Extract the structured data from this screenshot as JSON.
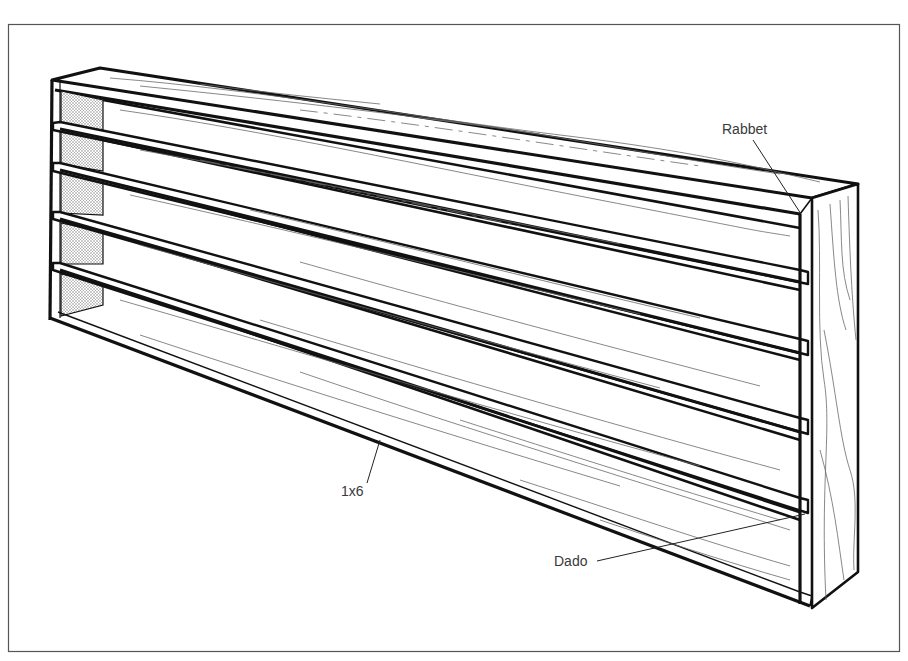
{
  "figure": {
    "frame": {
      "x": 8,
      "y": 24,
      "width": 892,
      "height": 628,
      "stroke": "#555555"
    },
    "colors": {
      "ink": "#111111",
      "grain": "#6a6a6a",
      "label": "#3a3a3a",
      "stipple": "#9a9a9a"
    }
  },
  "callouts": [
    {
      "id": "rabbet",
      "text": "Rabbet",
      "label_x": 722,
      "label_y": 122,
      "line": [
        [
          753,
          140
        ],
        [
          801,
          214
        ]
      ]
    },
    {
      "id": "board",
      "text": "1x6",
      "label_x": 341,
      "label_y": 489,
      "line": [
        [
          367,
          483
        ],
        [
          380,
          440
        ]
      ]
    },
    {
      "id": "dado",
      "text": "Dado",
      "label_x": 554,
      "label_y": 555,
      "line": [
        [
          597,
          561
        ],
        [
          805,
          514
        ]
      ]
    }
  ],
  "shelves": {
    "count_openings": 5,
    "left_lip_y": [
      75,
      122,
      162,
      213,
      265,
      318
    ],
    "right_lip_y": [
      214,
      282,
      352,
      432,
      512,
      600
    ]
  }
}
